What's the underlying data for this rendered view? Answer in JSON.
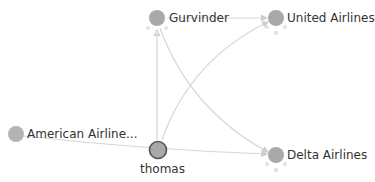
{
  "graph": {
    "nodes": [
      {
        "id": "gurvinder",
        "label": "Gurvinder",
        "x": 157,
        "y": 18,
        "selected": false
      },
      {
        "id": "united",
        "label": "United Airlines",
        "x": 276,
        "y": 18,
        "selected": false
      },
      {
        "id": "american",
        "label": "American Airline...",
        "x": 16,
        "y": 134,
        "selected": false
      },
      {
        "id": "thomas",
        "label": "thomas",
        "x": 162,
        "y": 150,
        "selected": true
      },
      {
        "id": "delta",
        "label": "Delta Airlines",
        "x": 276,
        "y": 155,
        "selected": false
      }
    ],
    "edges": [
      {
        "from": "gurvinder",
        "to": "united"
      },
      {
        "from": "thomas",
        "to": "gurvinder"
      },
      {
        "from": "thomas",
        "to": "united"
      },
      {
        "from": "gurvinder",
        "to": "delta"
      },
      {
        "from": "american",
        "to": "delta"
      },
      {
        "from": "thomas",
        "to": "delta"
      }
    ],
    "colors": {
      "node": "#a9a9a9",
      "edge": "#d4d4d4",
      "selected_outline": "#555555",
      "label": "#333333"
    }
  }
}
